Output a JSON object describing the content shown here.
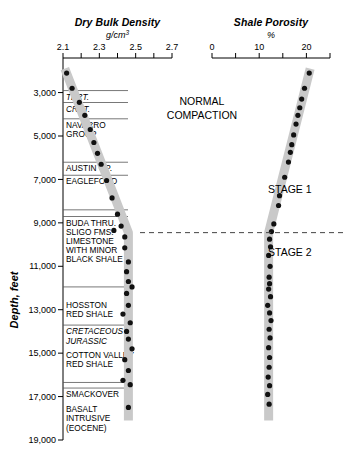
{
  "figure": {
    "depth_axis_label": "Depth, feet",
    "annotations": [
      {
        "name": "normal-compaction",
        "text_line1": "NORMAL",
        "text_line2": "COMPACTION"
      },
      {
        "name": "stage-1",
        "text": "STAGE 1"
      },
      {
        "name": "stage-2",
        "text": "STAGE 2"
      }
    ]
  },
  "chart_data": {
    "type": "scatter",
    "title": "",
    "orientation": "vertical-depth",
    "ylabel": "Depth, feet",
    "ylim": [
      1500,
      19000
    ],
    "yticks": [
      3000,
      5000,
      7000,
      9000,
      11000,
      13000,
      15000,
      17000,
      19000
    ],
    "ytick_labels": [
      "3,000",
      "5,000",
      "7,000",
      "9,000",
      "11,000",
      "13,000",
      "15,000",
      "17,000",
      "19,000"
    ],
    "grid": false,
    "legend": "none",
    "panels": [
      {
        "name": "dry-bulk-density",
        "title": "Dry Bulk Density",
        "units": "g/cm³",
        "xlabel": "Dry Bulk Density",
        "xlim": [
          2.1,
          2.7
        ],
        "xticks": [
          2.1,
          2.2,
          2.3,
          2.4,
          2.5,
          2.6,
          2.7
        ],
        "xtick_labels": [
          "2.1",
          "",
          "2.3",
          "",
          "2.5",
          "",
          "2.7"
        ],
        "trend_band": {
          "points": [
            [
              2.11,
              1900
            ],
            [
              2.46,
              9450
            ],
            [
              2.46,
              18100
            ]
          ],
          "color": "#c9c9c9",
          "width_px": 9
        },
        "points": [
          {
            "x": 2.12,
            "depth": 2100
          },
          {
            "x": 2.15,
            "depth": 2800
          },
          {
            "x": 2.19,
            "depth": 3450
          },
          {
            "x": 2.22,
            "depth": 4050
          },
          {
            "x": 2.25,
            "depth": 4700
          },
          {
            "x": 2.27,
            "depth": 5300
          },
          {
            "x": 2.29,
            "depth": 5800
          },
          {
            "x": 2.31,
            "depth": 6300
          },
          {
            "x": 2.34,
            "depth": 7050
          },
          {
            "x": 2.37,
            "depth": 7850
          },
          {
            "x": 2.4,
            "depth": 8600
          },
          {
            "x": 2.42,
            "depth": 9150
          },
          {
            "x": 2.38,
            "depth": 9350
          },
          {
            "x": 2.44,
            "depth": 9650
          },
          {
            "x": 2.44,
            "depth": 10150
          },
          {
            "x": 2.46,
            "depth": 10800
          },
          {
            "x": 2.45,
            "depth": 11250
          },
          {
            "x": 2.46,
            "depth": 11700
          },
          {
            "x": 2.48,
            "depth": 11950
          },
          {
            "x": 2.45,
            "depth": 12250
          },
          {
            "x": 2.46,
            "depth": 12800
          },
          {
            "x": 2.43,
            "depth": 13200
          },
          {
            "x": 2.47,
            "depth": 13600
          },
          {
            "x": 2.45,
            "depth": 14000
          },
          {
            "x": 2.46,
            "depth": 14350
          },
          {
            "x": 2.48,
            "depth": 14800
          },
          {
            "x": 2.44,
            "depth": 15300
          },
          {
            "x": 2.46,
            "depth": 15800
          },
          {
            "x": 2.43,
            "depth": 16250
          },
          {
            "x": 2.47,
            "depth": 16450
          },
          {
            "x": 2.46,
            "depth": 17500
          }
        ]
      },
      {
        "name": "shale-porosity",
        "title": "Shale Porosity",
        "units": "%",
        "xlabel": "Shale Porosity",
        "xlim": [
          0,
          25
        ],
        "xticks": [
          0,
          5,
          10,
          15,
          20,
          25
        ],
        "xtick_labels": [
          "0",
          "",
          "10",
          "",
          "20",
          ""
        ],
        "trend_band": {
          "points": [
            [
              20.8,
              1900
            ],
            [
              12.0,
              9450
            ],
            [
              12.0,
              18100
            ]
          ],
          "color": "#c9c9c9",
          "width_px": 9
        },
        "points": [
          {
            "x": 20.6,
            "depth": 2100
          },
          {
            "x": 19.6,
            "depth": 2800
          },
          {
            "x": 19.0,
            "depth": 3300
          },
          {
            "x": 18.6,
            "depth": 3700
          },
          {
            "x": 18.2,
            "depth": 4050
          },
          {
            "x": 17.8,
            "depth": 4450
          },
          {
            "x": 17.3,
            "depth": 4950
          },
          {
            "x": 16.9,
            "depth": 5400
          },
          {
            "x": 16.6,
            "depth": 5750
          },
          {
            "x": 16.2,
            "depth": 6200
          },
          {
            "x": 15.4,
            "depth": 6900
          },
          {
            "x": 14.3,
            "depth": 7750
          },
          {
            "x": 14.1,
            "depth": 8200
          },
          {
            "x": 13.1,
            "depth": 9050
          },
          {
            "x": 12.6,
            "depth": 9400
          },
          {
            "x": 12.2,
            "depth": 9750
          },
          {
            "x": 12.4,
            "depth": 10100
          },
          {
            "x": 12.0,
            "depth": 10500
          },
          {
            "x": 12.3,
            "depth": 11000
          },
          {
            "x": 12.1,
            "depth": 11500
          },
          {
            "x": 12.2,
            "depth": 11800
          },
          {
            "x": 12.0,
            "depth": 12050
          },
          {
            "x": 12.4,
            "depth": 12400
          },
          {
            "x": 11.8,
            "depth": 12800
          },
          {
            "x": 12.2,
            "depth": 13150
          },
          {
            "x": 12.5,
            "depth": 13500
          },
          {
            "x": 12.1,
            "depth": 13900
          },
          {
            "x": 12.3,
            "depth": 14300
          },
          {
            "x": 12.0,
            "depth": 14750
          },
          {
            "x": 12.2,
            "depth": 15200
          },
          {
            "x": 12.1,
            "depth": 15650
          },
          {
            "x": 11.9,
            "depth": 16100
          },
          {
            "x": 12.2,
            "depth": 16500
          },
          {
            "x": 11.8,
            "depth": 16900
          },
          {
            "x": 12.1,
            "depth": 17350
          }
        ]
      }
    ],
    "boundary_line": {
      "depth": 9450,
      "style": "dashed",
      "label": "Stage 1 / Stage 2 boundary"
    },
    "stratigraphy": [
      {
        "name": "tert",
        "label": "TERT.",
        "italic": true,
        "depth_top": 3000,
        "depth_bottom": 3550,
        "rule": true
      },
      {
        "name": "cret",
        "label": "CRET.",
        "italic": true,
        "depth_top": 3550,
        "depth_bottom": 4100,
        "rule": true
      },
      {
        "name": "navarro-group",
        "label": "NAVARRO",
        "label2": "GROUP",
        "italic": false,
        "depth_top": 4300,
        "depth_bottom": 6100,
        "rule": true
      },
      {
        "name": "austin-gp",
        "label": "AUSTIN GP.",
        "italic": false,
        "depth_top": 6300,
        "depth_bottom": 6900,
        "rule": true
      },
      {
        "name": "eagleford",
        "label": "EAGLEFORD",
        "italic": false,
        "depth_top": 6900,
        "depth_bottom": 7500,
        "rule": true
      },
      {
        "name": "buda-sligo",
        "label": "BUDA THRU.",
        "label2": "SLIGO FMS.",
        "label3": "LIMESTONE",
        "label4": "WITH MINOR",
        "label5": "BLACK SHALE",
        "italic": false,
        "depth_top": 8800,
        "depth_bottom": 11100,
        "rule": true
      },
      {
        "name": "hosston-red-shale",
        "label": "HOSSTON",
        "label2": "RED SHALE",
        "italic": false,
        "depth_top": 12600,
        "depth_bottom": 13600,
        "rule": false
      },
      {
        "name": "cretaceous",
        "label": "CRETACEOUS",
        "italic": true,
        "depth_top": 13800,
        "depth_bottom": 14200,
        "rule": true
      },
      {
        "name": "jurassic",
        "label": "JURASSIC",
        "italic": true,
        "depth_top": 14250,
        "depth_bottom": 14700,
        "rule": false
      },
      {
        "name": "cotton-valley",
        "label": "COTTON VALLEY",
        "label2": "RED SHALE",
        "italic": false,
        "depth_top": 14900,
        "depth_bottom": 15900,
        "rule": false
      },
      {
        "name": "smackover",
        "label": "SMACKOVER",
        "italic": false,
        "depth_top": 16700,
        "depth_bottom": 17200,
        "rule": true
      },
      {
        "name": "basalt-intrusive",
        "label": "BASALT",
        "label2": "INTRUSIVE",
        "label3": "(EOCENE)",
        "italic": false,
        "depth_top": 17400,
        "depth_bottom": 18900,
        "rule": false
      }
    ]
  },
  "labels": {
    "dbd_title": "Dry Bulk Density",
    "dbd_units": "g/cm³",
    "sp_title": "Shale Porosity",
    "sp_units": "%",
    "depth_axis": "Depth, feet",
    "normal_line1": "NORMAL",
    "normal_line2": "COMPACTION",
    "stage1": "STAGE 1",
    "stage2": "STAGE 2"
  }
}
